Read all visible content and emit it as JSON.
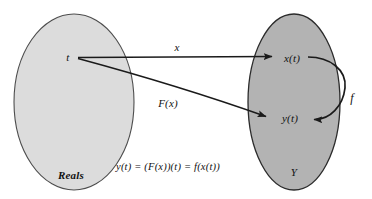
{
  "figure": {
    "type": "commutative-diagram",
    "background_color": "#ffffff",
    "stroke_color": "#1a1a1a",
    "equation": "y(t) = (F(x))(t) = f(x(t))"
  },
  "sets": {
    "domain": {
      "label": "Reals",
      "fill_color": "#dcdcdc",
      "border_color": "#4d4d4d",
      "cx": 74,
      "cy": 102,
      "rx": 60,
      "ry": 88
    },
    "codomain": {
      "label": "Y",
      "fill_color": "#b3b3b3",
      "border_color": "#2b2b2b",
      "cx": 294,
      "cy": 102,
      "rx": 46,
      "ry": 88
    }
  },
  "nodes": [
    {
      "id": "t",
      "label": "t",
      "set": "domain",
      "x": 68,
      "y": 57
    },
    {
      "id": "xt",
      "label": "x(t)",
      "set": "codomain",
      "x": 292,
      "y": 58
    },
    {
      "id": "yt",
      "label": "y(t)",
      "set": "codomain",
      "x": 290,
      "y": 118
    }
  ],
  "arrows": [
    {
      "id": "x-arrow",
      "label": "x",
      "from": "t",
      "to": "xt",
      "label_x": 177,
      "label_y": 47,
      "style": "straight"
    },
    {
      "id": "Fx-arrow",
      "label": "F(x)",
      "from": "t",
      "to": "yt",
      "label_x": 168,
      "label_y": 103,
      "style": "straight"
    },
    {
      "id": "f-arrow",
      "label": "f",
      "from": "xt",
      "to": "yt",
      "label_x": 352,
      "label_y": 98,
      "style": "curved-loop"
    }
  ]
}
